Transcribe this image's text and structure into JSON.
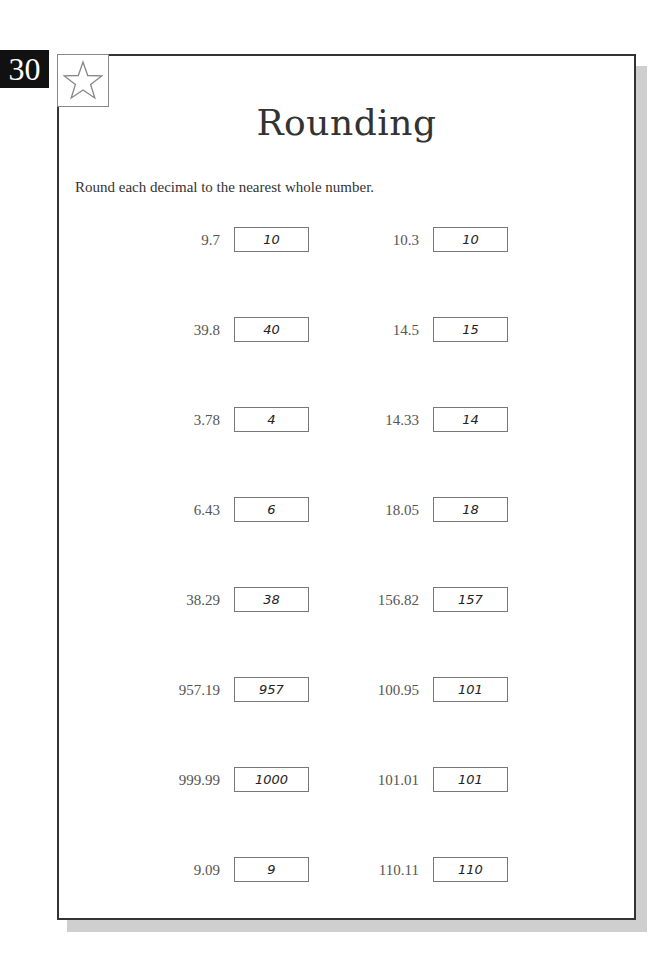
{
  "page_number": "30",
  "star_icon": "star-outline-icon",
  "title": "Rounding",
  "instructions": "Round each decimal to the nearest whole number.",
  "problems": {
    "left": [
      {
        "number": "9.7",
        "answer": "10"
      },
      {
        "number": "39.8",
        "answer": "40"
      },
      {
        "number": "3.78",
        "answer": "4"
      },
      {
        "number": "6.43",
        "answer": "6"
      },
      {
        "number": "38.29",
        "answer": "38"
      },
      {
        "number": "957.19",
        "answer": "957"
      },
      {
        "number": "999.99",
        "answer": "1000"
      },
      {
        "number": "9.09",
        "answer": "9"
      }
    ],
    "right": [
      {
        "number": "10.3",
        "answer": "10"
      },
      {
        "number": "14.5",
        "answer": "15"
      },
      {
        "number": "14.33",
        "answer": "14"
      },
      {
        "number": "18.05",
        "answer": "18"
      },
      {
        "number": "156.82",
        "answer": "157"
      },
      {
        "number": "100.95",
        "answer": "101"
      },
      {
        "number": "101.01",
        "answer": "101"
      },
      {
        "number": "110.11",
        "answer": "110"
      }
    ]
  }
}
